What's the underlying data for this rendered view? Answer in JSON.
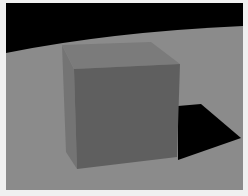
{
  "scene": {
    "description": "3D render of a grey cube on a grey floor with black sky and a hard black shadow",
    "colors": {
      "frame": "#f0f0f0",
      "sky": "#000000",
      "floor": "#8b8b8b",
      "cube_top": "#7b7b7b",
      "cube_left": "#747474",
      "cube_front": "#5f5f5f",
      "shadow": "#000000"
    }
  }
}
